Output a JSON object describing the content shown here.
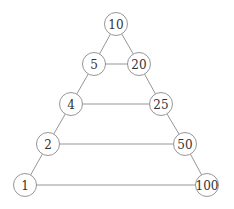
{
  "diagram": {
    "type": "graph",
    "nodes": [
      {
        "id": "n10",
        "label": "10"
      },
      {
        "id": "n5",
        "label": "5"
      },
      {
        "id": "n20",
        "label": "20"
      },
      {
        "id": "n4",
        "label": "4"
      },
      {
        "id": "n25",
        "label": "25"
      },
      {
        "id": "n2",
        "label": "2"
      },
      {
        "id": "n50",
        "label": "50"
      },
      {
        "id": "n1",
        "label": "1"
      },
      {
        "id": "n100",
        "label": "100"
      }
    ],
    "edges": [
      [
        "n10",
        "n5"
      ],
      [
        "n10",
        "n20"
      ],
      [
        "n5",
        "n20"
      ],
      [
        "n5",
        "n4"
      ],
      [
        "n20",
        "n25"
      ],
      [
        "n4",
        "n25"
      ],
      [
        "n4",
        "n2"
      ],
      [
        "n25",
        "n50"
      ],
      [
        "n2",
        "n50"
      ],
      [
        "n2",
        "n1"
      ],
      [
        "n50",
        "n100"
      ],
      [
        "n1",
        "n100"
      ]
    ]
  }
}
